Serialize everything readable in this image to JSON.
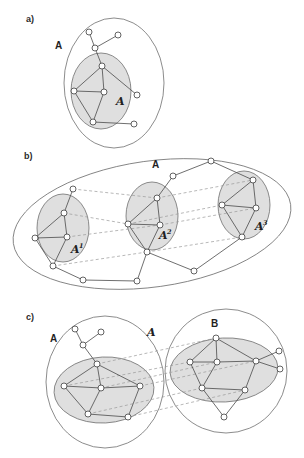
{
  "figure": {
    "background_color": "#ffffff",
    "width": 304,
    "height": 458,
    "colors": {
      "outer_fill": "#ffffff",
      "inner_fill": "#d9d9d9",
      "region_stroke": "#6f6f6f",
      "edge_stroke": "#4a4a4a",
      "dashed_stroke": "#9a9a9a",
      "node_fill": "#ffffff",
      "node_stroke": "#3c3c3c",
      "text_color": "#1f1f1f"
    }
  },
  "panels": [
    {
      "key": "a",
      "label": "a)",
      "label_x": 26,
      "label_y": 22,
      "outer_label": "A",
      "outer_label_x": 55,
      "outer_label_y": 49,
      "inner_label": "A",
      "inner_label_x": 116,
      "inner_label_y": 105,
      "outer_region": {
        "cx": 114,
        "cy": 83,
        "rx": 50,
        "ry": 65,
        "rotation": 0
      },
      "inner_regions": [
        {
          "label": "A",
          "cx": 101,
          "cy": 91,
          "rx": 30,
          "ry": 38,
          "rotation": 0
        }
      ],
      "nodes": [
        {
          "id": "a1",
          "x": 89,
          "y": 32
        },
        {
          "id": "a2",
          "x": 118,
          "y": 35
        },
        {
          "id": "a3",
          "x": 95,
          "y": 48
        },
        {
          "id": "a4",
          "x": 102,
          "y": 66
        },
        {
          "id": "a5",
          "x": 74,
          "y": 91
        },
        {
          "id": "a6",
          "x": 104,
          "y": 92
        },
        {
          "id": "a7",
          "x": 137,
          "y": 95
        },
        {
          "id": "a8",
          "x": 93,
          "y": 122
        },
        {
          "id": "a9",
          "x": 134,
          "y": 124
        }
      ],
      "edges": [
        [
          "a1",
          "a3"
        ],
        [
          "a2",
          "a3"
        ],
        [
          "a3",
          "a4"
        ],
        [
          "a4",
          "a5"
        ],
        [
          "a4",
          "a6"
        ],
        [
          "a4",
          "a7"
        ],
        [
          "a5",
          "a6"
        ],
        [
          "a5",
          "a8"
        ],
        [
          "a6",
          "a8"
        ],
        [
          "a8",
          "a9"
        ]
      ],
      "map_edges": []
    },
    {
      "key": "b",
      "label": "b)",
      "label_x": 24,
      "label_y": 159,
      "outer_label": "A",
      "outer_label_x": 152,
      "outer_label_y": 168,
      "outer_region": {
        "cx": 152,
        "cy": 224,
        "rx": 140,
        "ry": 63,
        "rotation": -8
      },
      "inner_regions": [
        {
          "label": "A",
          "sup": "1",
          "cx": 63,
          "cy": 228,
          "rx": 26,
          "ry": 34,
          "rotation": 0,
          "label_x": 71,
          "label_y": 253
        },
        {
          "label": "A",
          "sup": "2",
          "cx": 152,
          "cy": 216,
          "rx": 26,
          "ry": 34,
          "rotation": 0,
          "label_x": 159,
          "label_y": 239
        },
        {
          "label": "A",
          "sup": "3",
          "cx": 244,
          "cy": 205,
          "rx": 26,
          "ry": 34,
          "rotation": 0,
          "label_x": 255,
          "label_y": 230
        }
      ],
      "nodes": [
        {
          "id": "b1",
          "x": 73,
          "y": 189
        },
        {
          "id": "b2",
          "x": 64,
          "y": 213
        },
        {
          "id": "b3",
          "x": 35,
          "y": 238
        },
        {
          "id": "b4",
          "x": 67,
          "y": 237
        },
        {
          "id": "b5",
          "x": 53,
          "y": 266
        },
        {
          "id": "b6",
          "x": 83,
          "y": 280
        },
        {
          "id": "b7",
          "x": 157,
          "y": 198
        },
        {
          "id": "b8",
          "x": 173,
          "y": 176
        },
        {
          "id": "b9",
          "x": 211,
          "y": 161
        },
        {
          "id": "b10",
          "x": 128,
          "y": 224
        },
        {
          "id": "b11",
          "x": 160,
          "y": 225
        },
        {
          "id": "b12",
          "x": 147,
          "y": 252
        },
        {
          "id": "b13",
          "x": 137,
          "y": 281
        },
        {
          "id": "b14",
          "x": 194,
          "y": 271
        },
        {
          "id": "b15",
          "x": 253,
          "y": 180
        },
        {
          "id": "b16",
          "x": 222,
          "y": 205
        },
        {
          "id": "b17",
          "x": 256,
          "y": 208
        },
        {
          "id": "b18",
          "x": 242,
          "y": 237
        }
      ],
      "edges": [
        [
          "b1",
          "b2"
        ],
        [
          "b2",
          "b3"
        ],
        [
          "b2",
          "b4"
        ],
        [
          "b3",
          "b4"
        ],
        [
          "b3",
          "b5"
        ],
        [
          "b4",
          "b5"
        ],
        [
          "b5",
          "b6"
        ],
        [
          "b6",
          "b13"
        ],
        [
          "b7",
          "b8"
        ],
        [
          "b8",
          "b9"
        ],
        [
          "b9",
          "b15"
        ],
        [
          "b7",
          "b10"
        ],
        [
          "b7",
          "b11"
        ],
        [
          "b10",
          "b11"
        ],
        [
          "b10",
          "b12"
        ],
        [
          "b11",
          "b12"
        ],
        [
          "b12",
          "b13"
        ],
        [
          "b12",
          "b14"
        ],
        [
          "b14",
          "b18"
        ],
        [
          "b15",
          "b16"
        ],
        [
          "b15",
          "b17"
        ],
        [
          "b16",
          "b17"
        ],
        [
          "b16",
          "b18"
        ],
        [
          "b17",
          "b18"
        ]
      ],
      "map_edges": [
        [
          "b1",
          "b7"
        ],
        [
          "b7",
          "b15"
        ],
        [
          "b2",
          "b10"
        ],
        [
          "b10",
          "b16"
        ],
        [
          "b4",
          "b11"
        ],
        [
          "b11",
          "b17"
        ],
        [
          "b5",
          "b12"
        ],
        [
          "b12",
          "b18"
        ]
      ]
    },
    {
      "key": "c",
      "label": "c)",
      "label_x": 26,
      "label_y": 320,
      "outer_label": "A",
      "outer_label_x": 50,
      "outer_label_y": 342,
      "outer_label_b": "B",
      "outer_label_b_x": 211,
      "outer_label_b_y": 327,
      "mapping_label": "A",
      "mapping_label_x": 147,
      "mapping_label_y": 336,
      "outer_regions": [
        {
          "name": "A",
          "cx": 105,
          "cy": 382,
          "rx": 59,
          "ry": 66,
          "rotation": 0
        },
        {
          "name": "B",
          "cx": 226,
          "cy": 371,
          "rx": 61,
          "ry": 62,
          "rotation": 0
        }
      ],
      "inner_regions": [
        {
          "name": "A-sub",
          "cx": 104,
          "cy": 390,
          "rx": 50,
          "ry": 33,
          "rotation": -3
        },
        {
          "name": "B-sub",
          "cx": 224,
          "cy": 370,
          "rx": 54,
          "ry": 32,
          "rotation": -3
        }
      ],
      "nodes": [
        {
          "id": "c1",
          "x": 75,
          "y": 329
        },
        {
          "id": "c2",
          "x": 101,
          "y": 332
        },
        {
          "id": "c3",
          "x": 83,
          "y": 345
        },
        {
          "id": "c4",
          "x": 97,
          "y": 364
        },
        {
          "id": "c5",
          "x": 64,
          "y": 386
        },
        {
          "id": "c6",
          "x": 101,
          "y": 388
        },
        {
          "id": "c7",
          "x": 140,
          "y": 386
        },
        {
          "id": "c8",
          "x": 88,
          "y": 414
        },
        {
          "id": "c9",
          "x": 128,
          "y": 417
        },
        {
          "id": "d1",
          "x": 216,
          "y": 338
        },
        {
          "id": "d2",
          "x": 190,
          "y": 362
        },
        {
          "id": "d3",
          "x": 217,
          "y": 362
        },
        {
          "id": "d4",
          "x": 256,
          "y": 361
        },
        {
          "id": "d5",
          "x": 279,
          "y": 351
        },
        {
          "id": "d6",
          "x": 280,
          "y": 369
        },
        {
          "id": "d7",
          "x": 202,
          "y": 388
        },
        {
          "id": "d8",
          "x": 245,
          "y": 390
        },
        {
          "id": "d9",
          "x": 224,
          "y": 417
        }
      ],
      "edges": [
        [
          "c1",
          "c3"
        ],
        [
          "c2",
          "c3"
        ],
        [
          "c3",
          "c4"
        ],
        [
          "c4",
          "c5"
        ],
        [
          "c4",
          "c6"
        ],
        [
          "c4",
          "c7"
        ],
        [
          "c5",
          "c6"
        ],
        [
          "c5",
          "c8"
        ],
        [
          "c6",
          "c8"
        ],
        [
          "c6",
          "c7"
        ],
        [
          "c8",
          "c9"
        ],
        [
          "c7",
          "c9"
        ],
        [
          "d1",
          "d2"
        ],
        [
          "d1",
          "d3"
        ],
        [
          "d1",
          "d4"
        ],
        [
          "d2",
          "d3"
        ],
        [
          "d2",
          "d7"
        ],
        [
          "d3",
          "d4"
        ],
        [
          "d3",
          "d7"
        ],
        [
          "d4",
          "d5"
        ],
        [
          "d4",
          "d6"
        ],
        [
          "d4",
          "d8"
        ],
        [
          "d7",
          "d8"
        ],
        [
          "d7",
          "d9"
        ],
        [
          "d8",
          "d9"
        ]
      ],
      "map_edges": [
        [
          "c4",
          "d1"
        ],
        [
          "c5",
          "d2"
        ],
        [
          "c6",
          "d3"
        ],
        [
          "c7",
          "d4"
        ],
        [
          "c8",
          "d7"
        ],
        [
          "c9",
          "d8"
        ]
      ]
    }
  ]
}
